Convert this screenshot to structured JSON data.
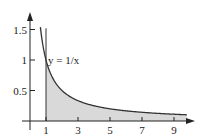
{
  "chart_data": {
    "type": "area",
    "title": "",
    "function": "y = 1/x",
    "curve_label": "y = 1/x",
    "xlabel": "",
    "ylabel": "",
    "xlim": [
      0,
      10
    ],
    "ylim": [
      0,
      1.6
    ],
    "x_ticks": [
      1,
      3,
      5,
      7,
      9
    ],
    "x_tick_labels": [
      "1",
      "3",
      "5",
      "7",
      "9"
    ],
    "y_ticks": [
      0.5,
      1,
      1.5
    ],
    "y_tick_labels": [
      "0.5",
      "1",
      "1.5"
    ],
    "shaded_region": {
      "x_from": 1,
      "x_to": 9.8,
      "description": "area under y=1/x from x=1 onward"
    },
    "series": [
      {
        "name": "y = 1/x",
        "x": [
          0.65,
          1,
          1.5,
          2,
          3,
          4,
          5,
          6,
          7,
          8,
          9,
          9.8
        ],
        "values": [
          1.54,
          1,
          0.667,
          0.5,
          0.333,
          0.25,
          0.2,
          0.167,
          0.143,
          0.125,
          0.111,
          0.102
        ]
      }
    ],
    "grid": false,
    "legend": "none"
  },
  "colors": {
    "axis": "#222222",
    "curve": "#333333",
    "fill": "#d9d9d9"
  }
}
